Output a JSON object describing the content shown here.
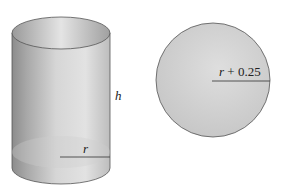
{
  "figures": {
    "cylinder": {
      "height_label": "h",
      "radius_label": "r"
    },
    "circle": {
      "radius_label_var": "r",
      "radius_label_rest": " + 0.25"
    }
  },
  "colors": {
    "outline": "#555555",
    "fill_light": "#d8d8d8",
    "fill_dark": "#8a8a8a",
    "circle_fill": "#cfcfcf"
  }
}
